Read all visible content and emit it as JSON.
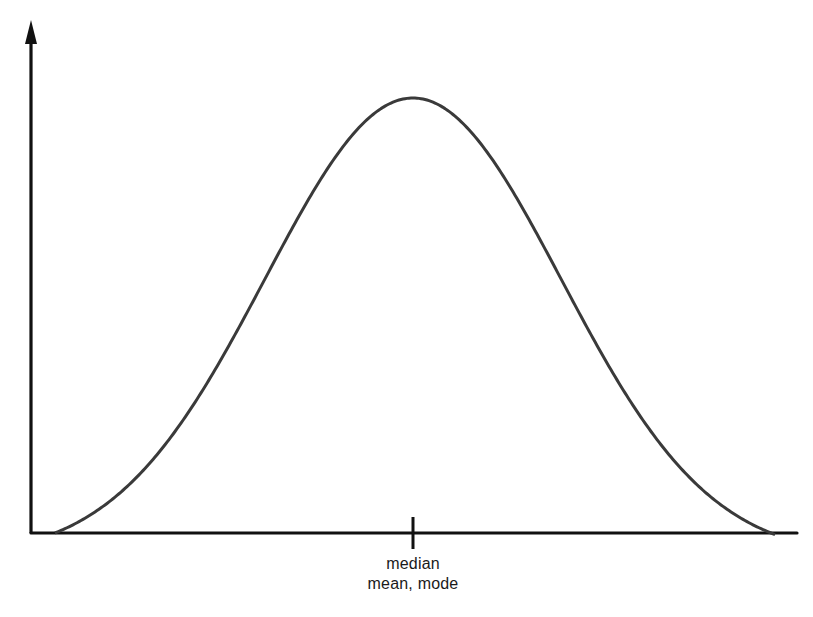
{
  "diagram": {
    "labels": {
      "center_line1": "median",
      "center_line2": "mean, mode"
    },
    "colors": {
      "axis": "#111111",
      "curve": "#3a3a3a",
      "background": "#ffffff"
    }
  },
  "chart_data": {
    "type": "line",
    "title": "",
    "xlabel": "",
    "ylabel": "",
    "distribution": "normal",
    "symmetric": true,
    "center_marker": {
      "position": "center",
      "labels": [
        "median",
        "mean, mode"
      ]
    },
    "annotations": [
      "median",
      "mean, mode"
    ],
    "grid": false,
    "legend": null,
    "pixel_geometry": {
      "y_axis_x": 31,
      "y_axis_top": 20,
      "baseline_y": 533,
      "x_axis_left": 31,
      "x_axis_right": 797,
      "peak_x": 413,
      "peak_y": 98,
      "sigma_px": 148,
      "curve_start_x": 55,
      "curve_end_x": 775,
      "tick_x": 413,
      "tick_top": 517,
      "tick_bottom": 549
    }
  }
}
